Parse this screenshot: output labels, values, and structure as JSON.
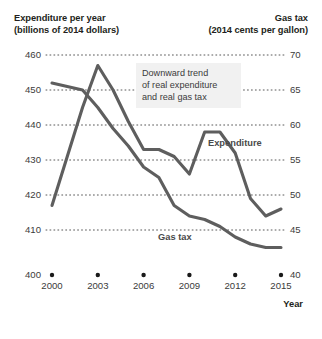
{
  "header": {
    "left_line1": "Expenditure per year",
    "left_line2": "(billions of 2014 dollars)",
    "right_line1": "Gas tax",
    "right_line2": "(2014 cents per gallon)"
  },
  "callout": {
    "line1": "Downward trend",
    "line2": "of real expenditure",
    "line3": "and real gas tax"
  },
  "axis": {
    "x_title": "Year"
  },
  "colors": {
    "line": "#5e5e5e",
    "grid": "#595959",
    "text": "#231f20",
    "callout_bg": "#f1f1f1"
  },
  "chart_data": {
    "type": "line",
    "title": "Downward trend of real expenditure and real gas tax",
    "xlabel": "Year",
    "ylabel": "Expenditure per year (billions of 2014 dollars)",
    "y2label": "Gas tax (2014 cents per gallon)",
    "xlim": [
      2000,
      2015
    ],
    "ylim": [
      400,
      460
    ],
    "y2lim": [
      40,
      70
    ],
    "yticks": [
      400,
      410,
      420,
      430,
      440,
      450,
      460
    ],
    "y2ticks": [
      40,
      45,
      50,
      55,
      60,
      65,
      70
    ],
    "xticks": [
      2000,
      2003,
      2006,
      2009,
      2012,
      2015
    ],
    "grid": true,
    "legend": "inline-labels",
    "series": [
      {
        "name": "Expenditure",
        "axis": "left",
        "units": "billions of 2014 dollars",
        "x": [
          2000,
          2001,
          2002,
          2003,
          2004,
          2005,
          2006,
          2007,
          2008,
          2009,
          2010,
          2011,
          2012,
          2013,
          2014,
          2015
        ],
        "values": [
          417,
          431,
          445,
          457,
          450,
          441,
          433,
          433,
          431,
          426,
          438,
          438,
          432,
          419,
          414,
          416
        ]
      },
      {
        "name": "Gas tax",
        "axis": "right",
        "units": "2014 cents per gallon",
        "x": [
          2000,
          2001,
          2002,
          2003,
          2004,
          2005,
          2006,
          2007,
          2008,
          2009,
          2010,
          2011,
          2012,
          2013,
          2014,
          2015
        ],
        "values": [
          66.0,
          65.5,
          65.0,
          62.5,
          59.5,
          57.0,
          54.0,
          52.5,
          48.5,
          47.0,
          46.5,
          45.5,
          44.0,
          43.0,
          42.5,
          42.5
        ]
      }
    ]
  }
}
